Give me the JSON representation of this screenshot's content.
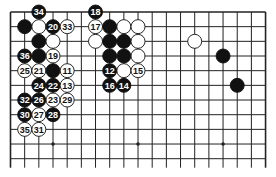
{
  "diagram": {
    "board_size": 19,
    "visible_rows": 11,
    "colors": {
      "black": "#111111",
      "white": "#ffffff",
      "line": "#222222",
      "background": "#ffffff"
    },
    "star_points": [
      [
        3,
        9
      ],
      [
        9,
        9
      ],
      [
        15,
        9
      ]
    ],
    "stones": [
      {
        "col": 2,
        "row": 0,
        "color": "black",
        "label": "34"
      },
      {
        "col": 6,
        "row": 0,
        "color": "black",
        "label": "18"
      },
      {
        "col": 1,
        "row": 1,
        "color": "black",
        "label": ""
      },
      {
        "col": 2,
        "row": 1,
        "color": "white",
        "label": ""
      },
      {
        "col": 3,
        "row": 1,
        "color": "black",
        "label": "20"
      },
      {
        "col": 4,
        "row": 1,
        "color": "white",
        "label": "33"
      },
      {
        "col": 6,
        "row": 1,
        "color": "white",
        "label": "17"
      },
      {
        "col": 7,
        "row": 1,
        "color": "black",
        "label": ""
      },
      {
        "col": 8,
        "row": 1,
        "color": "white",
        "label": ""
      },
      {
        "col": 9,
        "row": 1,
        "color": "white",
        "label": ""
      },
      {
        "col": 2,
        "row": 2,
        "color": "black",
        "label": ""
      },
      {
        "col": 3,
        "row": 2,
        "color": "white",
        "label": ""
      },
      {
        "col": 6,
        "row": 2,
        "color": "white",
        "label": ""
      },
      {
        "col": 7,
        "row": 2,
        "color": "black",
        "label": ""
      },
      {
        "col": 8,
        "row": 2,
        "color": "black",
        "label": ""
      },
      {
        "col": 9,
        "row": 2,
        "color": "white",
        "label": ""
      },
      {
        "col": 13,
        "row": 2,
        "color": "white",
        "label": ""
      },
      {
        "col": 1,
        "row": 3,
        "color": "black",
        "label": "36"
      },
      {
        "col": 2,
        "row": 3,
        "color": "black",
        "label": ""
      },
      {
        "col": 3,
        "row": 3,
        "color": "white",
        "label": "19"
      },
      {
        "col": 7,
        "row": 3,
        "color": "black",
        "label": ""
      },
      {
        "col": 8,
        "row": 3,
        "color": "black",
        "label": ""
      },
      {
        "col": 9,
        "row": 3,
        "color": "white",
        "label": ""
      },
      {
        "col": 15,
        "row": 3,
        "color": "black",
        "label": ""
      },
      {
        "col": 1,
        "row": 4,
        "color": "white",
        "label": "25"
      },
      {
        "col": 2,
        "row": 4,
        "color": "white",
        "label": "21"
      },
      {
        "col": 3,
        "row": 4,
        "color": "black",
        "label": ""
      },
      {
        "col": 4,
        "row": 4,
        "color": "white",
        "label": "11"
      },
      {
        "col": 7,
        "row": 4,
        "color": "black",
        "label": "12"
      },
      {
        "col": 8,
        "row": 4,
        "color": "white",
        "label": ""
      },
      {
        "col": 9,
        "row": 4,
        "color": "white",
        "label": "15"
      },
      {
        "col": 2,
        "row": 5,
        "color": "black",
        "label": "24"
      },
      {
        "col": 3,
        "row": 5,
        "color": "black",
        "label": "22"
      },
      {
        "col": 4,
        "row": 5,
        "color": "white",
        "label": "13"
      },
      {
        "col": 7,
        "row": 5,
        "color": "black",
        "label": "16"
      },
      {
        "col": 8,
        "row": 5,
        "color": "black",
        "label": "14"
      },
      {
        "col": 16,
        "row": 5,
        "color": "black",
        "label": ""
      },
      {
        "col": 1,
        "row": 6,
        "color": "black",
        "label": "32"
      },
      {
        "col": 2,
        "row": 6,
        "color": "black",
        "label": "26"
      },
      {
        "col": 3,
        "row": 6,
        "color": "white",
        "label": "23"
      },
      {
        "col": 4,
        "row": 6,
        "color": "white",
        "label": "29"
      },
      {
        "col": 1,
        "row": 7,
        "color": "black",
        "label": "30"
      },
      {
        "col": 2,
        "row": 7,
        "color": "white",
        "label": "27"
      },
      {
        "col": 3,
        "row": 7,
        "color": "black",
        "label": "28"
      },
      {
        "col": 1,
        "row": 8,
        "color": "white",
        "label": "35"
      },
      {
        "col": 2,
        "row": 8,
        "color": "white",
        "label": "31"
      }
    ]
  }
}
